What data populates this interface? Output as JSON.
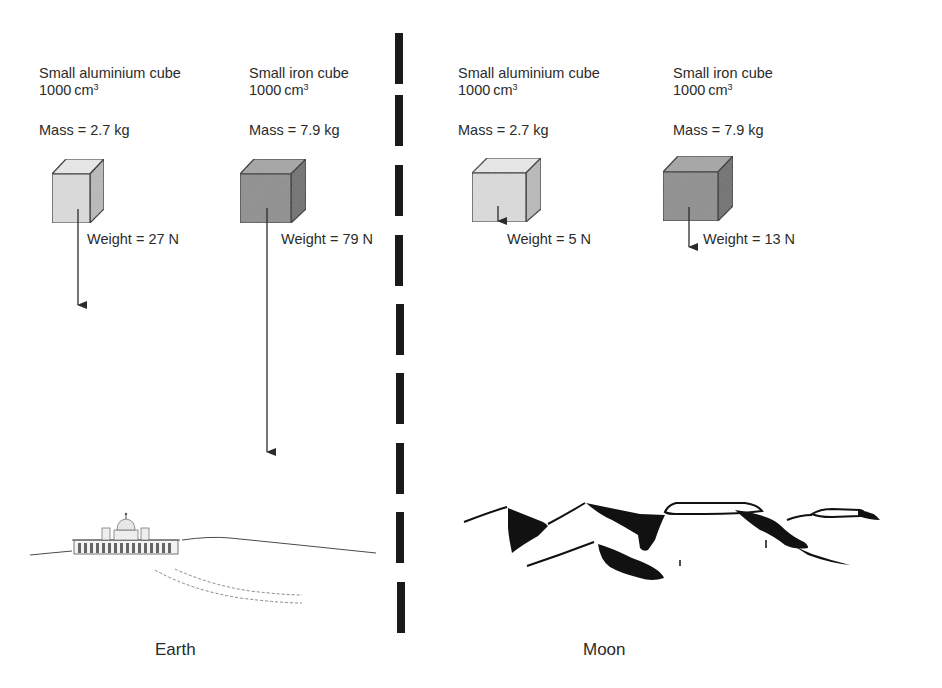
{
  "figure": {
    "type": "physics-diagram",
    "colors": {
      "aluminium_front": "#dcdcdc",
      "aluminium_top": "#e9e9e9",
      "aluminium_side": "#b9b9b9",
      "iron_front": "#8e8e8e",
      "iron_top": "#a5a5a5",
      "iron_side": "#6e6e6e",
      "outline": "#2b2b2b",
      "divider": "#1a1a1a"
    }
  },
  "panels": [
    {
      "place": "Earth",
      "cubes": [
        {
          "name": "Small aluminium cube",
          "volume_value": "1000",
          "volume_unit": "cm",
          "volume_exp": "3",
          "mass": "Mass = 2.7 kg",
          "weight": "Weight = 27 N",
          "weight_newtons": 27,
          "material": "aluminium"
        },
        {
          "name": "Small iron cube",
          "volume_value": "1000",
          "volume_unit": "cm",
          "volume_exp": "3",
          "mass": "Mass = 7.9 kg",
          "weight": "Weight = 79 N",
          "weight_newtons": 79,
          "material": "iron"
        }
      ]
    },
    {
      "place": "Moon",
      "cubes": [
        {
          "name": "Small aluminium cube",
          "volume_value": "1000",
          "volume_unit": "cm",
          "volume_exp": "3",
          "mass": "Mass = 2.7 kg",
          "weight": "Weight = 5 N",
          "weight_newtons": 5,
          "material": "aluminium"
        },
        {
          "name": "Small iron cube",
          "volume_value": "1000",
          "volume_unit": "cm",
          "volume_exp": "3",
          "mass": "Mass = 7.9 kg",
          "weight": "Weight = 13 N",
          "weight_newtons": 13,
          "material": "iron"
        }
      ]
    }
  ]
}
